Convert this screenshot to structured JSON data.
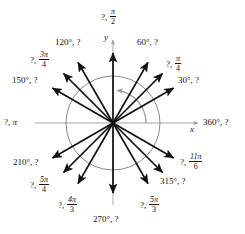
{
  "figure": {
    "axis_labels": {
      "x": "x",
      "y": "y"
    },
    "colors": {
      "ray": "#111111",
      "circle": "#8a8a8a",
      "axis": "#9a9a9a",
      "arc": "#9a9a9a",
      "text": "#141414",
      "background": "#ffffff"
    },
    "geometry": {
      "center_x": 113,
      "center_y": 123,
      "circle_radius": 47,
      "ray_length": 70
    },
    "sweep_arc": {
      "label": "counterclockwise angle sweep",
      "start_deg": 0,
      "end_deg": 97,
      "radius": 33
    }
  },
  "labels": [
    {
      "id": "deg-30",
      "angle": 30,
      "text_deg": "30°, ?",
      "mode": "deg",
      "x": 178,
      "y": 76
    },
    {
      "id": "rad-45",
      "angle": 45,
      "unknown": "?",
      "num": "π",
      "den": "4",
      "mode": "frac",
      "x": 166,
      "y": 55
    },
    {
      "id": "deg-60",
      "angle": 60,
      "text_deg": "60°, ?",
      "mode": "deg",
      "x": 137,
      "y": 38
    },
    {
      "id": "rad-90",
      "angle": 90,
      "unknown": "?",
      "num": "π",
      "den": "2",
      "mode": "frac",
      "x": 101,
      "y": 8
    },
    {
      "id": "deg-120",
      "angle": 120,
      "text_deg": "120°, ?",
      "mode": "deg",
      "x": 55,
      "y": 38
    },
    {
      "id": "rad-135",
      "angle": 135,
      "unknown": "?",
      "num": "3π",
      "den": "4",
      "mode": "frac",
      "x": 30,
      "y": 51
    },
    {
      "id": "deg-150",
      "angle": 150,
      "text_deg": "150°, ?",
      "mode": "deg",
      "x": 12,
      "y": 76
    },
    {
      "id": "rad-180",
      "angle": 180,
      "unknown": "?",
      "pi_only": "π",
      "mode": "pi",
      "x": 4,
      "y": 118
    },
    {
      "id": "deg-210",
      "angle": 210,
      "text_deg": "210°, ?",
      "mode": "deg",
      "x": 13,
      "y": 158
    },
    {
      "id": "rad-225",
      "angle": 225,
      "unknown": "?",
      "num": "5π",
      "den": "4",
      "mode": "frac",
      "x": 30,
      "y": 176
    },
    {
      "id": "rad-240",
      "angle": 240,
      "unknown": "?",
      "num": "4π",
      "den": "3",
      "mode": "frac",
      "x": 58,
      "y": 196
    },
    {
      "id": "deg-270",
      "angle": 270,
      "text_deg": "270°, ?",
      "mode": "deg",
      "x": 93,
      "y": 215
    },
    {
      "id": "rad-300",
      "angle": 300,
      "unknown": "?",
      "num": "5π",
      "den": "3",
      "mode": "frac",
      "x": 140,
      "y": 196
    },
    {
      "id": "deg-315",
      "angle": 315,
      "text_deg": "315°, ?",
      "mode": "deg",
      "x": 160,
      "y": 177
    },
    {
      "id": "rad-330",
      "angle": 330,
      "unknown": "?",
      "num": "11π",
      "den": "6",
      "mode": "frac",
      "x": 180,
      "y": 153
    },
    {
      "id": "deg-360",
      "angle": 360,
      "text_deg": "360°, ?",
      "mode": "deg",
      "x": 203,
      "y": 118
    }
  ],
  "rays": [
    {
      "id": "ray-30",
      "angle": 30
    },
    {
      "id": "ray-45",
      "angle": 45
    },
    {
      "id": "ray-60",
      "angle": 60
    },
    {
      "id": "ray-90",
      "angle": 90
    },
    {
      "id": "ray-120",
      "angle": 120
    },
    {
      "id": "ray-135",
      "angle": 135
    },
    {
      "id": "ray-150",
      "angle": 150
    },
    {
      "id": "ray-210",
      "angle": 210
    },
    {
      "id": "ray-225",
      "angle": 225
    },
    {
      "id": "ray-240",
      "angle": 240
    },
    {
      "id": "ray-270",
      "angle": 270
    },
    {
      "id": "ray-300",
      "angle": 300
    },
    {
      "id": "ray-315",
      "angle": 315
    },
    {
      "id": "ray-330",
      "angle": 330
    }
  ]
}
